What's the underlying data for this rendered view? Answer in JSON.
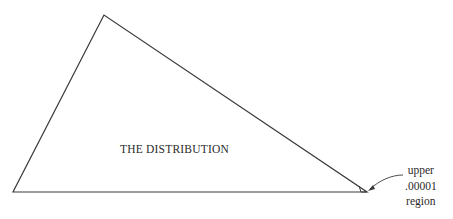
{
  "diagram": {
    "triangle": {
      "apex": [
        104,
        15
      ],
      "left_base": [
        13,
        192
      ],
      "right_base": [
        367,
        192
      ],
      "stroke": "#3a3a3a"
    },
    "tail_marker": {
      "points": [
        [
          358,
          186
        ],
        [
          360,
          192
        ],
        [
          367,
          192
        ]
      ]
    },
    "labels": {
      "distribution": "THE DISTRIBUTION",
      "region_line1": "upper",
      "region_line2": ".00001",
      "region_line3": "region"
    },
    "arrow": {
      "from": [
        403,
        176
      ],
      "to": [
        368,
        190
      ]
    }
  }
}
